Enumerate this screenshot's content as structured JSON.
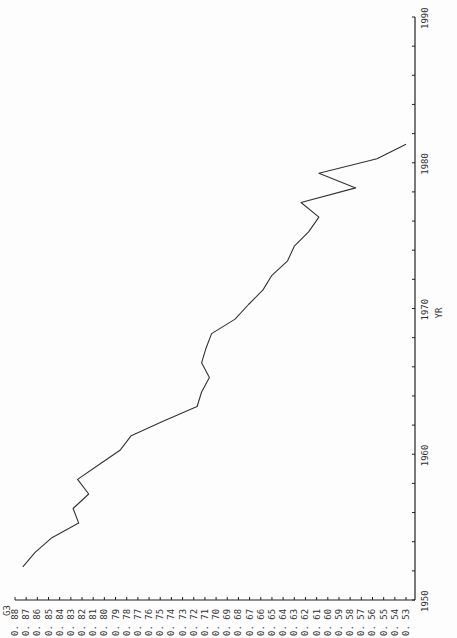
{
  "chart_data": {
    "type": "line",
    "orientation": "rotated-90-ccw",
    "title": "",
    "xlabel": "YR",
    "ylabel": "G3",
    "xlim": [
      1950,
      1990
    ],
    "ylim": [
      0.53,
      0.88
    ],
    "x_ticks": [
      1950,
      1960,
      1970,
      1980,
      1990
    ],
    "y_ticks": [
      "0.88",
      "0.87",
      "0.86",
      "0.85",
      "0.84",
      "0.83",
      "0.82",
      "0.81",
      "0.80",
      "0.79",
      "0.78",
      "0.77",
      "0.76",
      "0.75",
      "0.74",
      "0.73",
      "0.72",
      "0.71",
      "0.70",
      "0.69",
      "0.68",
      "0.67",
      "0.66",
      "0.65",
      "0.64",
      "0.63",
      "0.62",
      "0.61",
      "0.60",
      "0.59",
      "0.58",
      "0.57",
      "0.56",
      "0.55",
      "0.54",
      "0.53"
    ],
    "grid": false,
    "legend": null,
    "series": [
      {
        "name": "G3",
        "x": [
          1952,
          1953,
          1954,
          1955,
          1956,
          1957,
          1958,
          1959,
          1960,
          1961,
          1962,
          1963,
          1964,
          1965,
          1966,
          1967,
          1968,
          1969,
          1970,
          1971,
          1972,
          1973,
          1974,
          1975,
          1976,
          1977,
          1978,
          1979,
          1980,
          1981
        ],
        "values": [
          0.873,
          0.862,
          0.847,
          0.823,
          0.828,
          0.814,
          0.824,
          0.805,
          0.786,
          0.776,
          0.747,
          0.717,
          0.713,
          0.706,
          0.713,
          0.709,
          0.704,
          0.683,
          0.671,
          0.658,
          0.65,
          0.636,
          0.63,
          0.617,
          0.608,
          0.624,
          0.575,
          0.608,
          0.556,
          0.53
        ]
      }
    ]
  },
  "colors": {
    "line": "#333333",
    "axis": "#222222",
    "background": "#fdfdfd"
  }
}
